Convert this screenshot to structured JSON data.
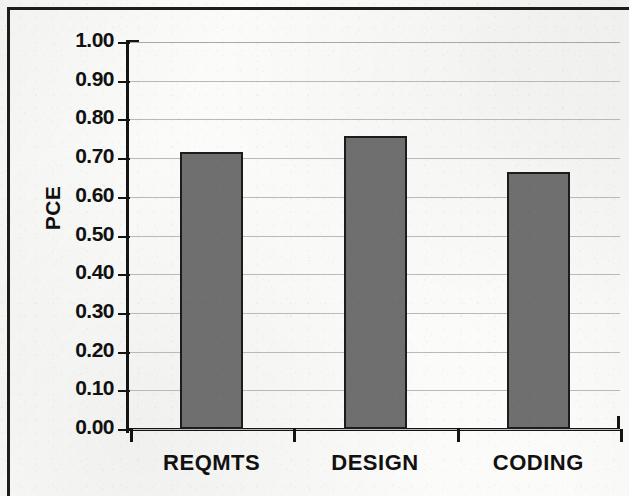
{
  "chart_data": {
    "type": "bar",
    "title": "",
    "subtitle": "",
    "xlabel": "",
    "ylabel": "PCE",
    "categories": [
      "REQMTS",
      "DESIGN",
      "CODING"
    ],
    "values": [
      0.715,
      0.757,
      0.665
    ],
    "series": [
      {
        "name": "PCE",
        "values": [
          0.715,
          0.757,
          0.665
        ]
      }
    ],
    "ylim": [
      0.0,
      1.0
    ],
    "ytick_labels": [
      "1.00",
      "0.90",
      "0.80",
      "0.70",
      "0.60",
      "0.50",
      "0.40",
      "0.30",
      "0.20",
      "0.10",
      "0.00"
    ],
    "ytick_values": [
      1.0,
      0.9,
      0.8,
      0.7,
      0.6,
      0.5,
      0.4,
      0.3,
      0.2,
      0.1,
      0.0
    ],
    "ytick_step": 0.1,
    "grid": true,
    "grid_axis": "y",
    "legend": false,
    "legend_position": "none",
    "annotations": [],
    "bar_color": "#6f6f6f",
    "bar_edge_color": "#1c1c1c",
    "grid_color": "#b9b9b9",
    "axis_color": "#141414",
    "background_color": "#f8f8f6",
    "text_color": "#111111"
  }
}
